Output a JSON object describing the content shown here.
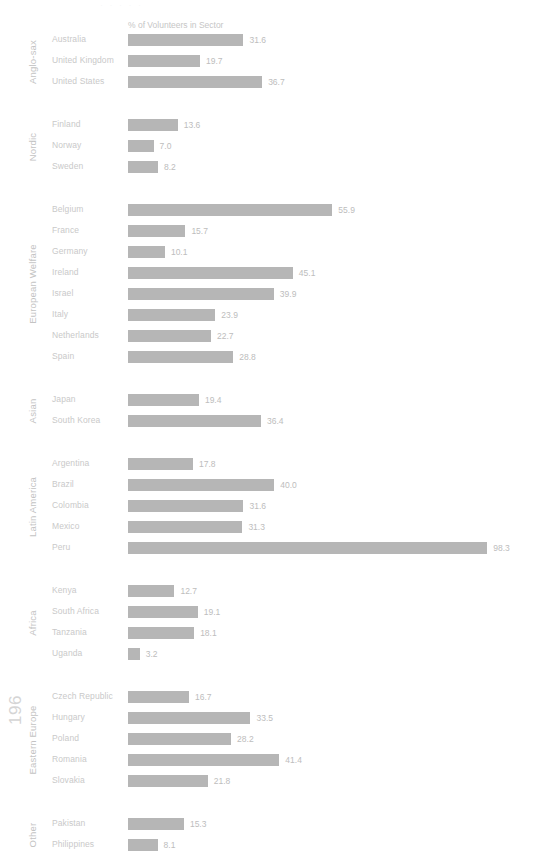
{
  "page": {
    "number": "196",
    "top_cut_text": "· · · · ·"
  },
  "chart_data": {
    "type": "bar",
    "orientation": "horizontal",
    "title": "",
    "xlabel": "% of Volunteers in Sector",
    "ylabel": "",
    "axis_title": "% of Volunteers in Sector",
    "xlim": [
      0,
      98.3
    ],
    "grid": false,
    "legend": null,
    "bar_color": "#b6b6b6",
    "label_color": "#c9c9c9",
    "value_color": "#bdbdbd",
    "categories": [
      "Australia",
      "United Kingdom",
      "United States",
      "Finland",
      "Norway",
      "Sweden",
      "Belgium",
      "France",
      "Germany",
      "Ireland",
      "Israel",
      "Italy",
      "Netherlands",
      "Spain",
      "Japan",
      "South Korea",
      "Argentina",
      "Brazil",
      "Colombia",
      "Mexico",
      "Peru",
      "Kenya",
      "South Africa",
      "Tanzania",
      "Uganda",
      "Czech Republic",
      "Hungary",
      "Poland",
      "Romania",
      "Slovakia",
      "Pakistan",
      "Philippines"
    ],
    "values": [
      31.6,
      19.7,
      36.7,
      13.6,
      7.0,
      8.2,
      55.9,
      15.7,
      10.1,
      45.1,
      39.9,
      23.9,
      22.7,
      28.8,
      19.4,
      36.4,
      17.8,
      40.0,
      31.6,
      31.3,
      98.3,
      12.7,
      19.1,
      18.1,
      3.2,
      16.7,
      33.5,
      28.2,
      41.4,
      21.8,
      15.3,
      8.1
    ],
    "groups": [
      {
        "label": "Anglo-sax",
        "items": [
          {
            "name": "Australia",
            "value": 31.6,
            "display": "31.6"
          },
          {
            "name": "United Kingdom",
            "value": 19.7,
            "display": "19.7"
          },
          {
            "name": "United States",
            "value": 36.7,
            "display": "36.7"
          }
        ]
      },
      {
        "label": "Nordic",
        "items": [
          {
            "name": "Finland",
            "value": 13.6,
            "display": "13.6"
          },
          {
            "name": "Norway",
            "value": 7.0,
            "display": "7.0"
          },
          {
            "name": "Sweden",
            "value": 8.2,
            "display": "8.2"
          }
        ]
      },
      {
        "label": "European Welfare",
        "items": [
          {
            "name": "Belgium",
            "value": 55.9,
            "display": "55.9"
          },
          {
            "name": "France",
            "value": 15.7,
            "display": "15.7"
          },
          {
            "name": "Germany",
            "value": 10.1,
            "display": "10.1"
          },
          {
            "name": "Ireland",
            "value": 45.1,
            "display": "45.1"
          },
          {
            "name": "Israel",
            "value": 39.9,
            "display": "39.9"
          },
          {
            "name": "Italy",
            "value": 23.9,
            "display": "23.9"
          },
          {
            "name": "Netherlands",
            "value": 22.7,
            "display": "22.7"
          },
          {
            "name": "Spain",
            "value": 28.8,
            "display": "28.8"
          }
        ]
      },
      {
        "label": "Asian",
        "items": [
          {
            "name": "Japan",
            "value": 19.4,
            "display": "19.4"
          },
          {
            "name": "South Korea",
            "value": 36.4,
            "display": "36.4"
          }
        ]
      },
      {
        "label": "Latin America",
        "items": [
          {
            "name": "Argentina",
            "value": 17.8,
            "display": "17.8"
          },
          {
            "name": "Brazil",
            "value": 40.0,
            "display": "40.0"
          },
          {
            "name": "Colombia",
            "value": 31.6,
            "display": "31.6"
          },
          {
            "name": "Mexico",
            "value": 31.3,
            "display": "31.3"
          },
          {
            "name": "Peru",
            "value": 98.3,
            "display": "98.3"
          }
        ]
      },
      {
        "label": "Africa",
        "items": [
          {
            "name": "Kenya",
            "value": 12.7,
            "display": "12.7"
          },
          {
            "name": "South Africa",
            "value": 19.1,
            "display": "19.1"
          },
          {
            "name": "Tanzania",
            "value": 18.1,
            "display": "18.1"
          },
          {
            "name": "Uganda",
            "value": 3.2,
            "display": "3.2"
          }
        ]
      },
      {
        "label": "Eastern Europe",
        "items": [
          {
            "name": "Czech Republic",
            "value": 16.7,
            "display": "16.7"
          },
          {
            "name": "Hungary",
            "value": 33.5,
            "display": "33.5"
          },
          {
            "name": "Poland",
            "value": 28.2,
            "display": "28.2"
          },
          {
            "name": "Romania",
            "value": 41.4,
            "display": "41.4"
          },
          {
            "name": "Slovakia",
            "value": 21.8,
            "display": "21.8"
          }
        ]
      },
      {
        "label": "Other",
        "items": [
          {
            "name": "Pakistan",
            "value": 15.3,
            "display": "15.3"
          },
          {
            "name": "Philippines",
            "value": 8.1,
            "display": "8.1"
          }
        ]
      }
    ]
  }
}
